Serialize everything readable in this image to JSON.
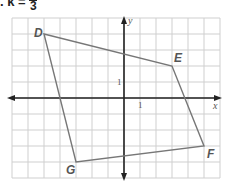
{
  "header": {
    "problem": ". k =",
    "numerator": "",
    "denominator": "3"
  },
  "graph": {
    "x_min": -7,
    "x_max": 6,
    "y_min": -5,
    "y_max": 5,
    "axis_labels": {
      "x": "x",
      "y": "y"
    },
    "tick_labels": {
      "x_one": "1",
      "y_one": "1"
    },
    "grid_color": "#cfcfcf",
    "polygon_color": "#777777"
  },
  "chart_data": {
    "type": "scatter",
    "xlabel": "x",
    "ylabel": "y",
    "xlim": [
      -7,
      6
    ],
    "ylim": [
      -5,
      5
    ],
    "grid": true,
    "points": [
      {
        "label": "D",
        "x": -5,
        "y": 4
      },
      {
        "label": "E",
        "x": 3,
        "y": 2
      },
      {
        "label": "F",
        "x": 5,
        "y": -3
      },
      {
        "label": "G",
        "x": -3,
        "y": -4
      }
    ]
  },
  "vertices": {
    "D": "D",
    "E": "E",
    "F": "F",
    "G": "G"
  }
}
